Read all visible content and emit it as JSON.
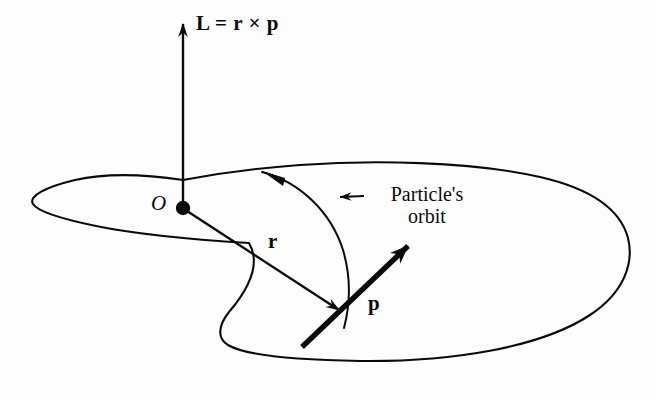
{
  "figure": {
    "type": "physics-vector-diagram",
    "background_color": "#fdfdfd",
    "ink_color": "#0a0a0a"
  },
  "labels": {
    "angular_momentum_equation": "L = r × p",
    "origin": "O",
    "position_vector": "r",
    "momentum_vector": "p",
    "orbit_callout_line1": "Particle's",
    "orbit_callout_line2": "orbit"
  },
  "elements": {
    "axis_arrow_name": "angular-momentum-axis-arrow",
    "origin_dot_name": "origin-point-dot",
    "orbit_curve_name": "particle-orbit-curve",
    "r_arrow_name": "position-vector-arrow",
    "p_arrow_name": "momentum-vector-arrow",
    "leader_name": "orbit-callout-leader-line"
  }
}
